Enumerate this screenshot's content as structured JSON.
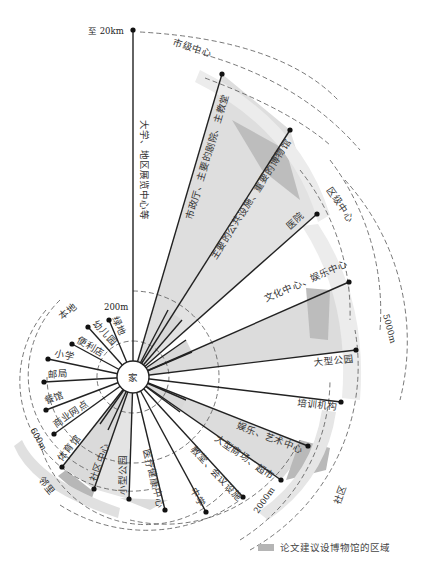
{
  "center": {
    "label": "家",
    "x": 133,
    "y": 377,
    "r": 16
  },
  "colors": {
    "sector": "#dcdcdc",
    "sector_dark": "#bdbdbd",
    "band": "#e4e4e4",
    "band_dark": "#b3b3b3",
    "line": "#222222"
  },
  "top_label": "至 20km",
  "distances": {
    "d200": "200m",
    "d600": "600m",
    "d2000": "2000m",
    "d5000": "5000m"
  },
  "zones": {
    "local": "本地",
    "neighborhood": "邻里",
    "community": "社区",
    "district": "区级中心",
    "city": "市级中心"
  },
  "spokes": [
    {
      "label": "大学、地区展览中心等",
      "x": 133,
      "y": 30
    },
    {
      "label": "市政厅、主要的剧院、主教堂",
      "x": 222,
      "y": 74
    },
    {
      "label": "主要的公共设施、重要的博物馆",
      "x": 290,
      "y": 130
    },
    {
      "label": "医院",
      "x": 317,
      "y": 214
    },
    {
      "label": "文化中心、娱乐中心",
      "x": 349,
      "y": 282
    },
    {
      "label": "大型公园",
      "x": 356,
      "y": 350
    },
    {
      "label": "培训机构",
      "x": 341,
      "y": 402
    },
    {
      "label": "娱乐、艺术中心",
      "x": 308,
      "y": 446
    },
    {
      "label": "大型商场、超市",
      "x": 281,
      "y": 480
    },
    {
      "label": "教堂、会议设施",
      "x": 243,
      "y": 497
    },
    {
      "label": "中学",
      "x": 206,
      "y": 512
    },
    {
      "label": "医疗健康中心",
      "x": 165,
      "y": 510
    },
    {
      "label": "小型公园",
      "x": 129,
      "y": 499
    },
    {
      "label": "社区中心",
      "x": 94,
      "y": 489
    },
    {
      "label": "体育馆",
      "x": 62,
      "y": 467
    },
    {
      "label": "商业网点",
      "x": 54,
      "y": 434
    },
    {
      "label": "餐馆",
      "x": 46,
      "y": 410
    },
    {
      "label": "邮局",
      "x": 44,
      "y": 382
    },
    {
      "label": "小学",
      "x": 48,
      "y": 359
    },
    {
      "label": "便利店",
      "x": 72,
      "y": 344
    },
    {
      "label": "幼儿园",
      "x": 88,
      "y": 327
    },
    {
      "label": "绿地",
      "x": 109,
      "y": 320
    }
  ],
  "legend": {
    "label": "论文建议设博物馆的区域"
  }
}
